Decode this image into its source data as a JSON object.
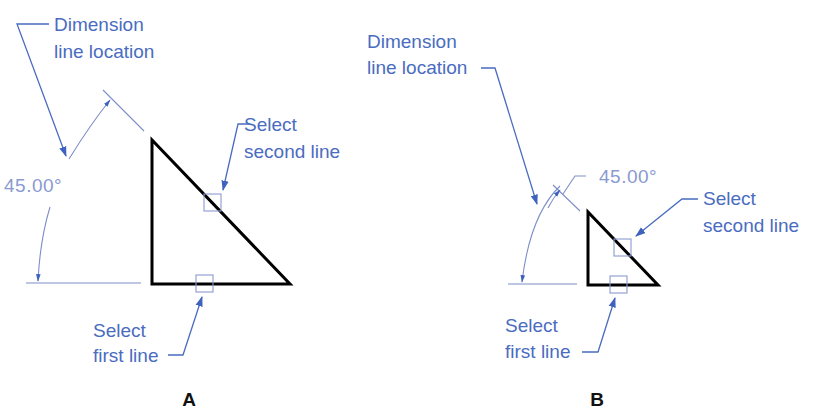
{
  "figure": {
    "colors": {
      "annotation": "#4a6cc0",
      "dimension_text": "#8a9ad0",
      "object_line": "#000000",
      "background": "#ffffff"
    },
    "panel_a": {
      "caption": "A",
      "dimension_location_label": [
        "Dimension",
        "line location"
      ],
      "angle_value": "45.00°",
      "second_line_label": [
        "Select",
        "second line"
      ],
      "first_line_label": [
        "Select",
        "first line"
      ]
    },
    "panel_b": {
      "caption": "B",
      "dimension_location_label": [
        "Dimension",
        "line location"
      ],
      "angle_value": "45.00°",
      "second_line_label": [
        "Select",
        "second line"
      ],
      "first_line_label": [
        "Select",
        "first line"
      ]
    }
  }
}
